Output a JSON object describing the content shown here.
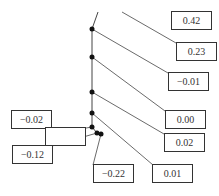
{
  "labels": [
    {
      "id": "l042",
      "text": "0.42",
      "x": 171,
      "y": 11,
      "w": 41,
      "h": 19
    },
    {
      "id": "l023",
      "text": "0.23",
      "x": 176,
      "y": 42,
      "w": 41,
      "h": 19
    },
    {
      "id": "lm001",
      "text": "−0.01",
      "x": 168,
      "y": 72,
      "w": 41,
      "h": 19
    },
    {
      "id": "l000",
      "text": "0.00",
      "x": 165,
      "y": 110,
      "w": 41,
      "h": 19
    },
    {
      "id": "l002",
      "text": "0.02",
      "x": 164,
      "y": 133,
      "w": 41,
      "h": 19
    },
    {
      "id": "l001",
      "text": "0.01",
      "x": 152,
      "y": 164,
      "w": 41,
      "h": 19
    },
    {
      "id": "lm022",
      "text": "−0.22",
      "x": 93,
      "y": 164,
      "w": 41,
      "h": 19
    },
    {
      "id": "lm002",
      "text": "−0.02",
      "x": 11,
      "y": 110,
      "w": 41,
      "h": 19
    },
    {
      "id": "lempty",
      "text": "",
      "x": 45,
      "y": 127,
      "w": 41,
      "h": 19
    },
    {
      "id": "lm012",
      "text": "−0.12",
      "x": 12,
      "y": 145,
      "w": 41,
      "h": 19
    }
  ],
  "points": [
    {
      "x": 92,
      "y": 29
    },
    {
      "x": 92,
      "y": 57
    },
    {
      "x": 92,
      "y": 92
    },
    {
      "x": 92,
      "y": 113
    },
    {
      "x": 92,
      "y": 127
    },
    {
      "x": 97,
      "y": 133
    },
    {
      "x": 101,
      "y": 134
    }
  ],
  "curve": [
    [
      98,
      12
    ],
    [
      92,
      29
    ],
    [
      92,
      57
    ],
    [
      92,
      92
    ],
    [
      92,
      113
    ],
    [
      92,
      127
    ],
    [
      97,
      133
    ],
    [
      101,
      134
    ]
  ],
  "leaders": [
    [
      [
        122,
        12
      ],
      [
        176,
        43
      ]
    ],
    [
      [
        92,
        29
      ],
      [
        168,
        73
      ]
    ],
    [
      [
        92,
        57
      ],
      [
        165,
        111
      ]
    ],
    [
      [
        92,
        92
      ],
      [
        164,
        134
      ]
    ],
    [
      [
        92,
        113
      ],
      [
        153,
        165
      ]
    ],
    [
      [
        101,
        134
      ],
      [
        93,
        165
      ]
    ],
    [
      [
        97,
        133
      ],
      [
        52,
        146
      ]
    ],
    [
      [
        92,
        127
      ],
      [
        86,
        128
      ]
    ]
  ],
  "colors": {
    "line": "#444444",
    "point": "#111111",
    "box": "#333333"
  }
}
